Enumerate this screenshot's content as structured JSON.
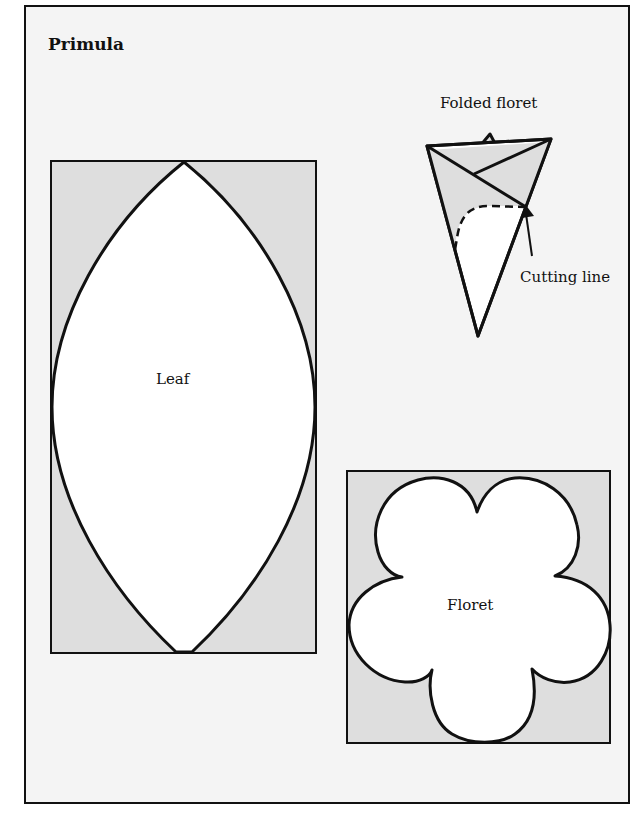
{
  "title": "Primula",
  "colors": {
    "page_background": "#f4f4f4",
    "template_shade": "#dedede",
    "shape_fill": "#ffffff",
    "stroke": "#111111"
  },
  "diagram": {
    "folded_floret": {
      "label": "Folded floret",
      "annotation": "Cutting line"
    },
    "leaf": {
      "label": "Leaf"
    },
    "floret": {
      "label": "Floret"
    }
  }
}
